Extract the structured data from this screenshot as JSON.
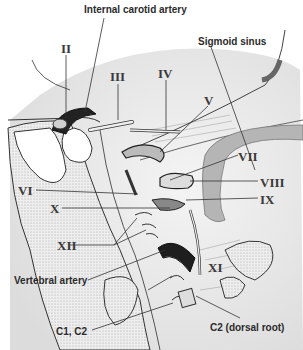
{
  "figure": {
    "type": "anatomical-illustration",
    "colors": {
      "background": "#ffffff",
      "shading": "#e6e6e6",
      "stipple": "#d2d2d2",
      "line": "#333333",
      "vessel_dark": "#1e1e1e",
      "sinus": "#8a8a8a"
    }
  },
  "labels": {
    "internal_carotid": "Internal carotid artery",
    "sigmoid_sinus": "Sigmoid sinus",
    "ii": "II",
    "iii": "III",
    "iv": "IV",
    "v": "V",
    "vi": "VI",
    "vii": "VII",
    "viii": "VIII",
    "ix": "IX",
    "x": "X",
    "xi": "XI",
    "xii": "XII",
    "vertebral_artery": "Vertebral artery",
    "c1c2": "C1, C2",
    "c2_dorsal": "C2 (dorsal root)"
  }
}
